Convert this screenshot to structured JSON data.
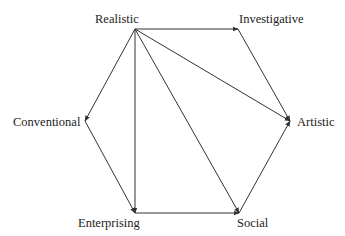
{
  "diagram": {
    "type": "directed-hexagon",
    "nodes": [
      {
        "id": "realistic",
        "label": "Realistic",
        "x": 135,
        "y": 29,
        "lx": 95,
        "ly": 12
      },
      {
        "id": "investigative",
        "label": "Investigative",
        "x": 238,
        "y": 29,
        "lx": 239,
        "ly": 12
      },
      {
        "id": "artistic",
        "label": "Artistic",
        "x": 290,
        "y": 121,
        "lx": 297,
        "ly": 115
      },
      {
        "id": "social",
        "label": "Social",
        "x": 239,
        "y": 213,
        "lx": 237,
        "ly": 216
      },
      {
        "id": "enterprising",
        "label": "Enterprising",
        "x": 135,
        "y": 213,
        "lx": 78,
        "ly": 216
      },
      {
        "id": "conventional",
        "label": "Conventional",
        "x": 85,
        "y": 121,
        "lx": 13,
        "ly": 115
      }
    ],
    "edges": [
      {
        "from": "realistic",
        "to": "investigative"
      },
      {
        "from": "realistic",
        "to": "artistic"
      },
      {
        "from": "realistic",
        "to": "social"
      },
      {
        "from": "realistic",
        "to": "enterprising"
      },
      {
        "from": "realistic",
        "to": "conventional"
      },
      {
        "from": "investigative",
        "to": "artistic"
      },
      {
        "from": "conventional",
        "to": "enterprising"
      },
      {
        "from": "enterprising",
        "to": "social"
      },
      {
        "from": "social",
        "to": "artistic"
      }
    ],
    "colors": {
      "line": "#333333",
      "text": "#222222",
      "background": "#ffffff"
    }
  }
}
